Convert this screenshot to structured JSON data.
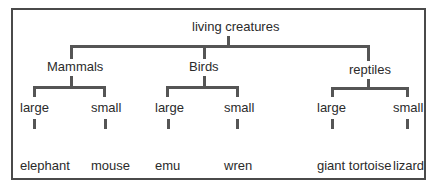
{
  "diagram": {
    "type": "tree",
    "root": "living creatures",
    "groups": [
      {
        "label": "Mammals",
        "children": [
          {
            "label": "large",
            "items": [
              "elephant",
              "hippo"
            ]
          },
          {
            "label": "small",
            "items": [
              "mouse",
              "shrew"
            ]
          }
        ]
      },
      {
        "label": "Birds",
        "children": [
          {
            "label": "large",
            "items": [
              "emu",
              "ostrich"
            ]
          },
          {
            "label": "small",
            "items": [
              "wren",
              "bee",
              "humming bird"
            ]
          }
        ]
      },
      {
        "label": "reptiles",
        "children": [
          {
            "label": "large",
            "items": [
              "giant tortoise",
              "saltwater",
              "crocodile"
            ]
          },
          {
            "label": "small",
            "items": [
              "lizard",
              "dwarf",
              "gecko"
            ]
          }
        ]
      }
    ],
    "colors": {
      "line": "#555555",
      "text": "#2b2b2b",
      "border": "#4a4a4a"
    }
  }
}
